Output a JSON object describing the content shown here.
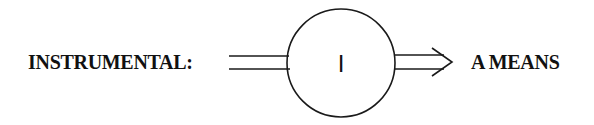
{
  "diagram": {
    "left_label": "INSTRUMENTAL:",
    "node_label": "I",
    "right_label": "A MEANS",
    "stroke_color": "#1a1a1a",
    "text_color": "#111111"
  }
}
